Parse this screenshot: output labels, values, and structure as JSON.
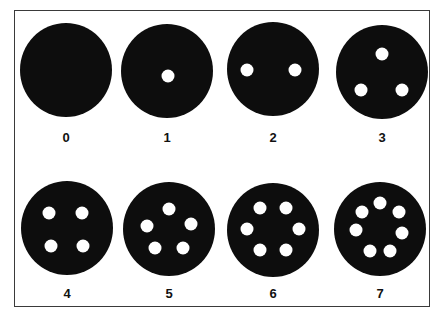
{
  "title": "",
  "colors": {
    "disk": "#0d0d0d",
    "hole": "#ffffff",
    "border": "#3a3a3a",
    "label": "#111111"
  },
  "disks": [
    {
      "label": "0",
      "holes": 0
    },
    {
      "label": "1",
      "holes": 1
    },
    {
      "label": "2",
      "holes": 2
    },
    {
      "label": "3",
      "holes": 3
    },
    {
      "label": "4",
      "holes": 4
    },
    {
      "label": "5",
      "holes": 5
    },
    {
      "label": "6",
      "holes": 6
    },
    {
      "label": "7",
      "holes": 7
    }
  ]
}
